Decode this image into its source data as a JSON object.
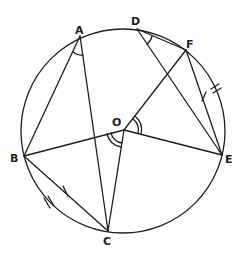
{
  "diagram": {
    "points": {
      "A": {
        "label": "A"
      },
      "B": {
        "label": "B"
      },
      "C": {
        "label": "C"
      },
      "D": {
        "label": "D"
      },
      "E": {
        "label": "E"
      },
      "F": {
        "label": "F"
      },
      "O": {
        "label": "O"
      }
    },
    "segments": [
      "AB",
      "AC",
      "DF",
      "DE",
      "OF",
      "OB",
      "OC",
      "OE",
      "BC",
      "FE"
    ],
    "angle_marks": [
      {
        "vertex": "A",
        "between": [
          "B",
          "C"
        ],
        "style": "single-arc"
      },
      {
        "vertex": "D",
        "between": [
          "F",
          "E"
        ],
        "style": "single-arc"
      },
      {
        "vertex": "O",
        "between": [
          "F",
          "E"
        ],
        "style": "double-arc"
      },
      {
        "vertex": "O",
        "between": [
          "B",
          "C"
        ],
        "style": "double-arc"
      }
    ],
    "tick_marks": [
      {
        "on": "chord BC",
        "count": 1
      },
      {
        "on": "chord FE",
        "count": 1
      },
      {
        "on": "arc BC",
        "count": 2
      },
      {
        "on": "arc FE",
        "count": 2
      }
    ],
    "colors": {
      "stroke": "#1e1e1e",
      "background": "#ffffff"
    }
  }
}
